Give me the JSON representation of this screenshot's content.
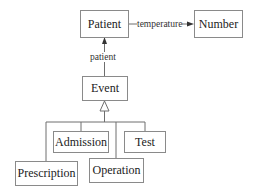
{
  "diagram": {
    "type": "uml-class-diagram",
    "nodes": {
      "patient": "Patient",
      "number": "Number",
      "event": "Event",
      "admission": "Admission",
      "test": "Test",
      "prescription": "Prescription",
      "operation": "Operation"
    },
    "edges": [
      {
        "from": "Patient",
        "to": "Number",
        "label": "temperature",
        "kind": "association-arrow"
      },
      {
        "from": "Event",
        "to": "Patient",
        "label": "patient",
        "kind": "association-arrow"
      },
      {
        "from": "Admission",
        "to": "Event",
        "label": "",
        "kind": "generalization"
      },
      {
        "from": "Test",
        "to": "Event",
        "label": "",
        "kind": "generalization"
      },
      {
        "from": "Prescription",
        "to": "Event",
        "label": "",
        "kind": "generalization"
      },
      {
        "from": "Operation",
        "to": "Event",
        "label": "",
        "kind": "generalization"
      }
    ],
    "edge_labels": {
      "temperature": "temperature",
      "patient": "patient"
    },
    "colors": {
      "line": "#6e6e6e",
      "box_border": "#8a8a8a",
      "text": "#222222"
    }
  }
}
